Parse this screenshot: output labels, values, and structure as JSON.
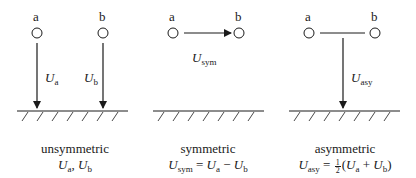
{
  "panels": [
    {
      "id": "unsymmetric",
      "node_a": "a",
      "node_b": "b",
      "arrow_a_label": {
        "main": "U",
        "sub": "a"
      },
      "arrow_b_label": {
        "main": "U",
        "sub": "b"
      },
      "caption": "unsymmetric",
      "formula": {
        "u1": "U",
        "s1": "a",
        "sep": ", ",
        "u2": "U",
        "s2": "b"
      }
    },
    {
      "id": "symmetric",
      "node_a": "a",
      "node_b": "b",
      "arrow_label": {
        "main": "U",
        "sub": "sym"
      },
      "caption": "symmetric",
      "formula": {
        "lhs": "U",
        "lhs_sub": "sym",
        "eq": " = ",
        "u1": "U",
        "s1": "a",
        "op": " − ",
        "u2": "U",
        "s2": "b"
      }
    },
    {
      "id": "asymmetric",
      "node_a": "a",
      "node_b": "b",
      "arrow_label": {
        "main": "U",
        "sub": "asy"
      },
      "caption": "asymmetric",
      "formula": {
        "lhs": "U",
        "lhs_sub": "asy",
        "eq": " = ",
        "frac_num": "1",
        "frac_den": "2",
        "open": "(",
        "u1": "U",
        "s1": "a",
        "op": " + ",
        "u2": "U",
        "s2": "b",
        "close": ")"
      }
    }
  ]
}
